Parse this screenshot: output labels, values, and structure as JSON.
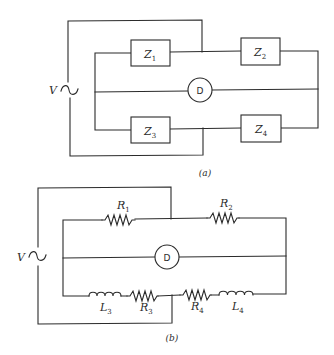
{
  "figure": {
    "a": {
      "caption": "(a)",
      "source": {
        "label": "V",
        "symbol": "ac-source"
      },
      "components": [
        {
          "id": "Z1",
          "letter": "Z",
          "subscript": "1",
          "kind": "impedance"
        },
        {
          "id": "Z2",
          "letter": "Z",
          "subscript": "2",
          "kind": "impedance"
        },
        {
          "id": "Z3",
          "letter": "Z",
          "subscript": "3",
          "kind": "impedance"
        },
        {
          "id": "Z4",
          "letter": "Z",
          "subscript": "4",
          "kind": "impedance"
        }
      ],
      "detector": {
        "label": "D"
      }
    },
    "b": {
      "caption": "(b)",
      "source": {
        "label": "V",
        "symbol": "ac-source"
      },
      "components": [
        {
          "id": "R1",
          "letter": "R",
          "subscript": "1",
          "kind": "resistor"
        },
        {
          "id": "R2",
          "letter": "R",
          "subscript": "2",
          "kind": "resistor"
        },
        {
          "id": "L3",
          "letter": "L",
          "subscript": "3",
          "kind": "inductor"
        },
        {
          "id": "R3",
          "letter": "R",
          "subscript": "3",
          "kind": "resistor"
        },
        {
          "id": "R4",
          "letter": "R",
          "subscript": "4",
          "kind": "resistor"
        },
        {
          "id": "L4",
          "letter": "L",
          "subscript": "4",
          "kind": "inductor"
        }
      ],
      "detector": {
        "label": "D"
      }
    }
  }
}
